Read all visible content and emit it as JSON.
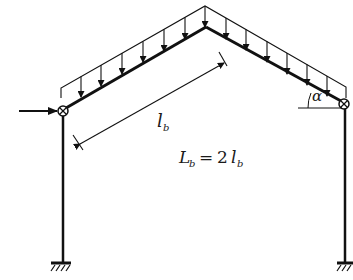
{
  "diagram": {
    "type": "pitched-roof portal frame",
    "labels": {
      "top_load_label": "q",
      "rafter_length": {
        "main": "l",
        "sub": "b"
      },
      "span_equation": {
        "L": "L",
        "L_sub": "b",
        "equals": "=",
        "coef": "2",
        "l": "l",
        "l_sub": "b"
      },
      "angle": "α"
    },
    "elements": {
      "left_column": "column",
      "right_column": "column",
      "left_rafter": "rafter",
      "right_rafter": "rafter",
      "supports": [
        "fixed",
        "fixed"
      ],
      "knee_joints": [
        "pinned",
        "pinned"
      ],
      "distributed_load": "uniform vertical load on rafters",
      "point_load": "horizontal force at left knee"
    },
    "colors": {
      "line": "#111111",
      "background": "#ffffff"
    }
  }
}
